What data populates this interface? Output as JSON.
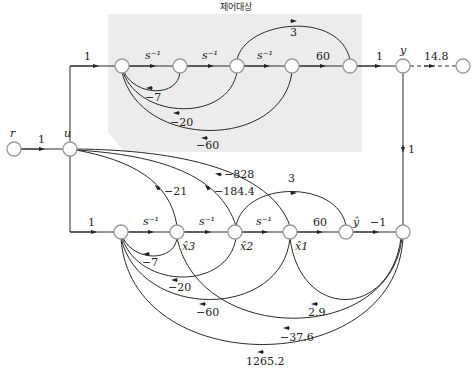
{
  "diagram": {
    "title": "제어대상",
    "shade_color": "#ececec",
    "input_node": {
      "label": "r"
    },
    "control_node": {
      "label": "u"
    },
    "output_node": {
      "label": "y"
    },
    "observer_output_node": {
      "label": "ŷ"
    },
    "state_labels": [
      "x̂3",
      "x̂2",
      "x̂1"
    ],
    "plant": {
      "forward_gains": [
        "1",
        "s⁻¹",
        "s⁻¹",
        "s⁻¹",
        "60",
        "1"
      ],
      "feedforward_gain": "3",
      "feedback_gains": [
        "−7",
        "−20",
        "−60"
      ]
    },
    "output_branch_gain": "14.8",
    "r_to_u_gain": "1",
    "y_to_observer_gain": "1",
    "observer": {
      "forward_gains": [
        "1",
        "s⁻¹",
        "s⁻¹",
        "s⁻¹",
        "60",
        "−1"
      ],
      "feedforward_gain": "3",
      "state_feedback_gains": [
        "−21",
        "−184.4",
        "−828"
      ],
      "internal_feedback_gains": [
        "−7",
        "−20",
        "−60"
      ],
      "error_gains": [
        "2.9",
        "−37.6",
        "1265.2"
      ]
    }
  }
}
